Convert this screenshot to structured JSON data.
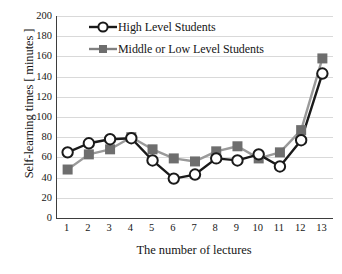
{
  "chart_data": {
    "type": "line",
    "title": "",
    "xlabel": "The number of lectures",
    "ylabel": "Self-learning times [ minutes ]",
    "categories": [
      "1",
      "2",
      "3",
      "4",
      "5",
      "6",
      "7",
      "8",
      "9",
      "10",
      "11",
      "12",
      "13"
    ],
    "x": [
      1,
      2,
      3,
      4,
      5,
      6,
      7,
      8,
      9,
      10,
      11,
      12,
      13
    ],
    "series": [
      {
        "name": "High Level Students",
        "color": "#1a1a1a",
        "marker": "open-circle",
        "values": [
          65,
          74,
          78,
          79,
          57,
          39,
          43,
          59,
          57,
          63,
          51,
          77,
          143
        ]
      },
      {
        "name": "Middle or Low Level Students",
        "color": "#808080",
        "marker": "filled-square",
        "values": [
          48,
          63,
          68,
          80,
          68,
          59,
          56,
          66,
          71,
          59,
          65,
          87,
          158
        ]
      }
    ],
    "ylim": [
      0,
      200
    ],
    "ytick_values": [
      0,
      20,
      40,
      60,
      80,
      100,
      120,
      140,
      160,
      180,
      200
    ],
    "ytick_labels": [
      "0",
      "20",
      "40",
      "60",
      "80",
      "100",
      "120",
      "140",
      "160",
      "180",
      "200"
    ],
    "xlim": [
      0.5,
      13.5
    ],
    "grid": "horizontal",
    "grid_color": "#d9d9d9",
    "legend_position": "top-center",
    "axis_color": "#3d3d3d",
    "background": "#ffffff"
  },
  "legend": {
    "items": [
      {
        "label": "High Level Students"
      },
      {
        "label": "Middle or Low Level Students"
      }
    ]
  }
}
